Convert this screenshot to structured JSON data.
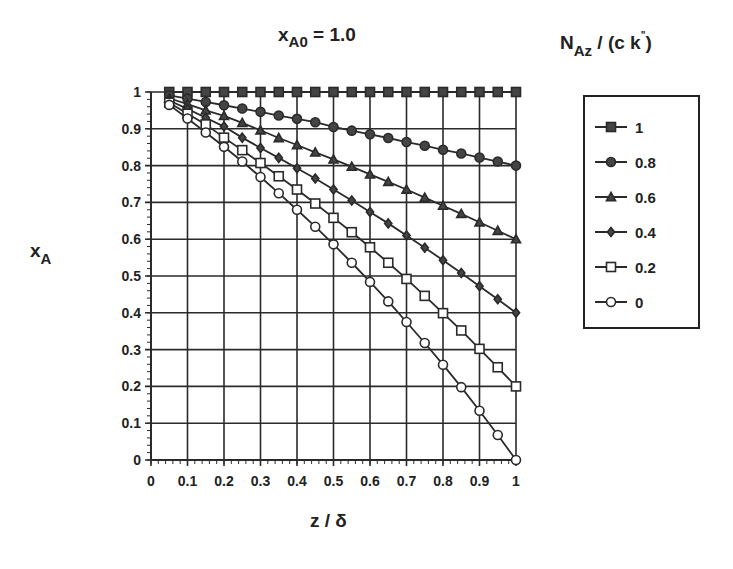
{
  "chart_data": {
    "type": "line",
    "title": "xA0 = 1.0",
    "title_parts": {
      "var": "x",
      "sub": "A0",
      "rest": " = 1.0"
    },
    "xlabel": "z / δ",
    "ylabel": "xA",
    "ylabel_parts": {
      "var": "x",
      "sub": "A"
    },
    "xlim": [
      0,
      1
    ],
    "ylim": [
      0,
      1
    ],
    "xticks": [
      "0",
      "0.1",
      "0.2",
      "0.3",
      "0.4",
      "0.5",
      "0.6",
      "0.7",
      "0.8",
      "0.9",
      "1"
    ],
    "yticks": [
      "0",
      "0.1",
      "0.2",
      "0.3",
      "0.4",
      "0.5",
      "0.6",
      "0.7",
      "0.8",
      "0.9",
      "1"
    ],
    "grid": true,
    "legend_title": "NAz/(c k\")",
    "legend_title_parts": {
      "var": "N",
      "sub": "Az",
      "rest": " / (c k",
      "sup": "\"",
      "close": ")"
    },
    "legend_position": "right",
    "x": [
      0.05,
      0.1,
      0.15,
      0.2,
      0.25,
      0.3,
      0.35,
      0.4,
      0.45,
      0.5,
      0.55,
      0.6,
      0.65,
      0.7,
      0.75,
      0.8,
      0.85,
      0.9,
      0.95,
      1.0
    ],
    "series": [
      {
        "name": "1",
        "marker": "filled-square",
        "values": [
          1,
          1,
          1,
          1,
          1,
          1,
          1,
          1,
          1,
          1,
          1,
          1,
          1,
          1,
          1,
          1,
          1,
          1,
          1,
          1
        ]
      },
      {
        "name": "0.8",
        "marker": "filled-circle",
        "values": [
          0.991,
          0.982,
          0.973,
          0.964,
          0.955,
          0.946,
          0.936,
          0.927,
          0.918,
          0.905,
          0.895,
          0.885,
          0.875,
          0.864,
          0.854,
          0.843,
          0.833,
          0.822,
          0.811,
          0.8
        ]
      },
      {
        "name": "0.6",
        "marker": "filled-triangle",
        "values": [
          0.983,
          0.967,
          0.95,
          0.935,
          0.916,
          0.896,
          0.875,
          0.856,
          0.836,
          0.817,
          0.797,
          0.776,
          0.756,
          0.735,
          0.713,
          0.691,
          0.669,
          0.646,
          0.623,
          0.6
        ]
      },
      {
        "name": "0.4",
        "marker": "filled-diamond",
        "values": [
          0.977,
          0.954,
          0.93,
          0.906,
          0.876,
          0.848,
          0.821,
          0.793,
          0.765,
          0.735,
          0.705,
          0.674,
          0.643,
          0.61,
          0.577,
          0.543,
          0.508,
          0.472,
          0.437,
          0.4
        ]
      },
      {
        "name": "0.2",
        "marker": "open-square",
        "values": [
          0.971,
          0.941,
          0.912,
          0.876,
          0.842,
          0.807,
          0.771,
          0.735,
          0.697,
          0.658,
          0.619,
          0.578,
          0.536,
          0.492,
          0.446,
          0.399,
          0.352,
          0.302,
          0.252,
          0.2
        ]
      },
      {
        "name": "0",
        "marker": "open-circle",
        "values": [
          0.965,
          0.928,
          0.89,
          0.851,
          0.811,
          0.769,
          0.725,
          0.68,
          0.634,
          0.586,
          0.536,
          0.484,
          0.431,
          0.375,
          0.318,
          0.259,
          0.198,
          0.134,
          0.068,
          0.0
        ]
      }
    ]
  }
}
